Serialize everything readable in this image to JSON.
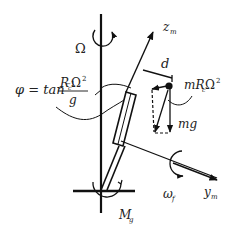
{
  "diagram": {
    "labels": {
      "omega_cap": "Ω",
      "phi_lhs": "φ = tan",
      "phi_exp": "−1",
      "phi_num_R": "R",
      "phi_num_sub": "c",
      "phi_num_omega": "Ω",
      "phi_num_sup": "2",
      "phi_den": "g",
      "z_axis": "z",
      "z_sub": "m",
      "d": "d",
      "centrifugal_m": "mR",
      "centrifugal_sub": "c",
      "centrifugal_omega": "Ω",
      "centrifugal_sup": "2",
      "gravity": "mg",
      "omega_f": "ω",
      "omega_f_sub": "f",
      "y_axis": "y",
      "y_sub": "m",
      "moment": "M",
      "moment_sub": "g"
    },
    "colors": {
      "stroke": "#111111",
      "background": "#ffffff"
    }
  }
}
